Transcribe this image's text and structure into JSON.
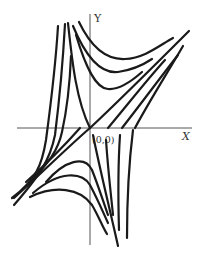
{
  "diagram": {
    "type": "phase-portrait",
    "axes": {
      "x_label": "X",
      "y_label": "Y",
      "origin_label": "(0,0)"
    },
    "colors": {
      "curve": "#1a1a1a",
      "axis": "#555555",
      "background": "#ffffff"
    },
    "trajectories": {
      "upper_left_steep": [
        "M58,26 C56,60 52,95 46,140 C42,165 36,180 12,198",
        "M65,24 C63,60 60,95 55,135 C50,160 40,175 14,205",
        "M71,56 C70,80 68,105 62,132 C58,150 50,162 27,185",
        "M68,23 C72,60 76,100 90,128"
      ],
      "upper_saddle": [
        "M79,22 C90,45 105,60 125,59 C145,58 160,45 173,38",
        "M73,26 C85,55 100,74 118,72 C132,70 143,65 152,59",
        "M76,35 C85,65 95,88 108,89 C120,90 133,80 142,72"
      ],
      "right_diagonals": [
        "M90,128 C120,100 160,60 189,31",
        "M108,128 C125,108 145,82 165,60",
        "M122,128 C140,105 160,78 178,55",
        "M135,128 C150,100 168,72 183,46"
      ],
      "lower_saddle": [
        "M46,182 C65,160 85,155 92,170 C98,185 102,198 108,215",
        "M33,193 C60,170 82,172 90,185 C98,200 102,210 108,223",
        "M30,197 C55,185 80,188 92,205 C98,215 103,228 107,234"
      ],
      "lower_right_steep": [
        "M93,135 C100,170 110,210 118,246",
        "M106,140 C108,170 111,195 113,215",
        "M120,135 C118,165 118,195 119,230",
        "M133,130 C128,170 127,210 127,238"
      ]
    }
  }
}
